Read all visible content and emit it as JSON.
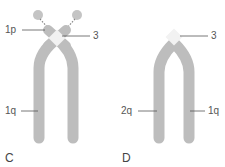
{
  "panels": [
    {
      "id": "C",
      "label": "C",
      "annotations": [
        {
          "id": "1p",
          "text": "1p"
        },
        {
          "id": "3",
          "text": "3"
        },
        {
          "id": "1q",
          "text": "1q"
        }
      ]
    },
    {
      "id": "D",
      "label": "D",
      "annotations": [
        {
          "id": "3",
          "text": "3"
        },
        {
          "id": "2q",
          "text": "2q"
        },
        {
          "id": "1q",
          "text": "1q"
        }
      ]
    }
  ],
  "colors": {
    "chromatid": "#bdbdbd",
    "chromatid_edge": "#a8a8a8",
    "centromere": "#f2f2f2",
    "satellite": "#c4c4c4",
    "leader_line": "#555555",
    "text": "#444444"
  }
}
